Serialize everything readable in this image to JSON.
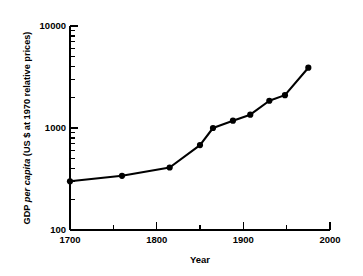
{
  "chart_data": {
    "type": "line",
    "title": "",
    "subtitle": "",
    "xlabel": "Year",
    "ylabel": "GDP per capita (US $ at 1970 relative prices)",
    "ylabel_parts": {
      "prefix": "GDP ",
      "italic": "per capita",
      "suffix": " (US $ at 1970 relative prices)"
    },
    "x": [
      1700,
      1760,
      1815,
      1850,
      1865,
      1888,
      1908,
      1930,
      1948,
      1975
    ],
    "values": [
      300,
      340,
      410,
      680,
      1000,
      1180,
      1350,
      1850,
      2100,
      3900
    ],
    "series": [
      {
        "name": "GDP per capita",
        "values": [
          300,
          340,
          410,
          680,
          1000,
          1180,
          1350,
          1850,
          2100,
          3900
        ]
      }
    ],
    "xlim": [
      1700,
      2000
    ],
    "ylim": [
      100,
      10000
    ],
    "yscale": "log",
    "xscale": "linear",
    "grid": false,
    "legend": false,
    "legend_position": "none",
    "marker": "filled-circle",
    "line_color": "#000000",
    "marker_color": "#000000",
    "background_color": "#ffffff",
    "x_ticks_major": [
      1700,
      1800,
      1900,
      2000
    ],
    "x_tick_labels": [
      "1700",
      "1800",
      "1900",
      "2000"
    ],
    "x_ticks_minor": [
      1750,
      1850,
      1950
    ],
    "y_ticks_major": [
      100,
      1000,
      10000
    ],
    "y_tick_labels": [
      "100",
      "1000",
      "10000"
    ],
    "y_ticks_minor": [
      200,
      300,
      400,
      500,
      600,
      700,
      800,
      900,
      2000,
      3000,
      4000,
      5000,
      6000,
      7000,
      8000,
      9000
    ],
    "axis_style": "left-and-bottom-spines"
  }
}
